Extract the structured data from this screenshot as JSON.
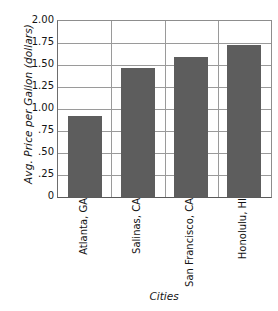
{
  "chart_data": {
    "type": "bar",
    "title": "",
    "xlabel": "Cities",
    "ylabel": "Avg. Price per Gallon (dollars)",
    "categories": [
      "Atlanta, GA",
      "Salinas, CA",
      "San Francisco, CA",
      "Honolulu, HI"
    ],
    "values": [
      0.92,
      1.47,
      1.59,
      1.73
    ],
    "ylim": [
      0,
      2.0
    ],
    "ytick_values": [
      2.0,
      1.75,
      1.5,
      1.25,
      1.0,
      0.75,
      0.5,
      0.25,
      0
    ],
    "ytick_labels": [
      "2.00",
      "1.75",
      "1.50",
      "1.25",
      "1.00",
      ".75",
      ".50",
      ".25",
      "0"
    ],
    "grid": "horizontal-and-vertical",
    "legend": "none",
    "bar_color": "#5d5d5d",
    "grid_color": "#9a9a9a",
    "axis_color": "#5a5a5a",
    "background_color": "#ffffff"
  },
  "axes": {
    "y_title": "Avg. Price per Gallon (dollars)",
    "x_title": "Cities"
  }
}
